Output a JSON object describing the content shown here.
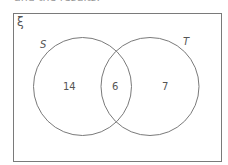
{
  "header": {
    "cutoff_text": "and the results."
  },
  "diagram": {
    "universal_symbol": "ξ",
    "sets": [
      {
        "name": "S",
        "only_count": "14"
      },
      {
        "name": "T",
        "only_count": "7"
      }
    ],
    "intersection_count": "6",
    "colors": {
      "outline": "#7a7a7a",
      "text": "#555555"
    }
  }
}
